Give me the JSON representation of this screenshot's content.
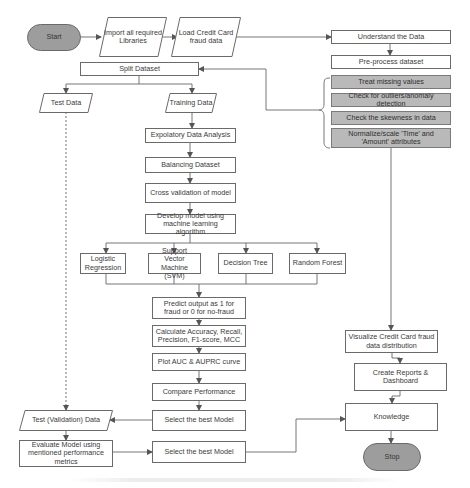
{
  "diagram": {
    "type": "flowchart",
    "colors": {
      "terminal_fill": "#9d9d9d",
      "preprocess_fill": "#b9b9b9",
      "stroke": "#6a6a6a",
      "background": "#ffffff"
    },
    "nodes": {
      "start": "Start",
      "import_libraries": "Import all required Libraries",
      "load_data": "Load Credit Card fraud data",
      "understand_data": "Understand the Data",
      "preprocess": "Pre-process dataset",
      "treat_missing": "Treat missing values",
      "check_outliers": "Check for outliers/anomaly detection",
      "check_skewness": "Check the skewness in data",
      "normalize": "Normalize/scale 'Time' and 'Amount' attributes",
      "split_dataset": "Split Dataset",
      "test_data": "Test Data",
      "training_data": "Training Data",
      "eda": "Expolatory Data Analysis",
      "balancing": "Balancing Dataset",
      "cross_validation": "Cross validation of model",
      "develop_model": "Develop model using machine learning algorithm",
      "logistic_regression": "Logistic Regression",
      "svm": "Support Vector Machine (SVM)",
      "decision_tree": "Decision Tree",
      "random_forest": "Random Forest",
      "predict_output": "Predict output as 1 for fraud or 0 for no-fraud",
      "calculate_metrics": "Calculate Accuracy, Recall, Precision, F1-score, MCC",
      "plot_curves": "Plot AUC & AUPRC curve",
      "compare_performance": "Compare Performance",
      "select_best_1": "Select the best Model",
      "test_validation": "Test (Validation) Data",
      "evaluate_model": "Evaluate Model using mentioned performance metrics",
      "select_best_2": "Select the best Model",
      "visualize": "Visualize Credit Card fraud data distribution",
      "create_reports": "Create Reports & Dashboard",
      "knowledge": "Knowledge",
      "stop": "Stop"
    },
    "edges": [
      [
        "start",
        "import_libraries"
      ],
      [
        "import_libraries",
        "load_data"
      ],
      [
        "load_data",
        "understand_data"
      ],
      [
        "understand_data",
        "preprocess"
      ],
      [
        "preprocess_steps",
        "split_dataset"
      ],
      [
        "split_dataset",
        "test_data"
      ],
      [
        "split_dataset",
        "training_data"
      ],
      [
        "training_data",
        "eda"
      ],
      [
        "eda",
        "balancing"
      ],
      [
        "balancing",
        "cross_validation"
      ],
      [
        "cross_validation",
        "develop_model"
      ],
      [
        "develop_model",
        "logistic_regression"
      ],
      [
        "develop_model",
        "svm"
      ],
      [
        "develop_model",
        "decision_tree"
      ],
      [
        "develop_model",
        "random_forest"
      ],
      [
        "models",
        "predict_output"
      ],
      [
        "predict_output",
        "calculate_metrics"
      ],
      [
        "calculate_metrics",
        "plot_curves"
      ],
      [
        "plot_curves",
        "compare_performance"
      ],
      [
        "compare_performance",
        "select_best_1"
      ],
      [
        "select_best_1",
        "test_validation"
      ],
      [
        "test_data",
        "test_validation",
        "dashed"
      ],
      [
        "test_validation",
        "evaluate_model"
      ],
      [
        "evaluate_model",
        "select_best_2"
      ],
      [
        "select_best_2",
        "knowledge"
      ],
      [
        "normalize",
        "visualize"
      ],
      [
        "visualize",
        "create_reports"
      ],
      [
        "create_reports",
        "knowledge"
      ],
      [
        "knowledge",
        "stop"
      ]
    ]
  }
}
